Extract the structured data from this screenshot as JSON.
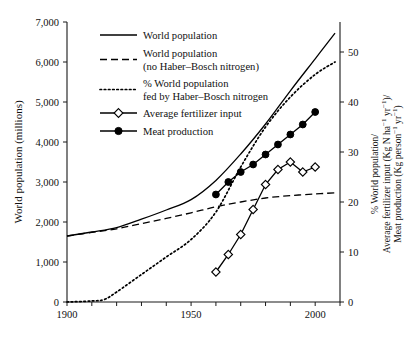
{
  "chart_data": {
    "type": "line",
    "title": "",
    "xlabel": "",
    "ylabel": "World population (millions)",
    "y2label_lines": [
      "% World population/",
      "Average fertilizer input (Kg N ha−1 yr−1)/",
      "Meat production (Kg person−1 yr−1)"
    ],
    "xlim": [
      1900,
      2010
    ],
    "ylim": [
      0,
      7000
    ],
    "y2lim": [
      0,
      56
    ],
    "grid": false,
    "legend_position": "top-left-inside",
    "xticks": [
      1900,
      1910,
      1920,
      1930,
      1940,
      1950,
      1960,
      1970,
      1980,
      1990,
      2000,
      2010
    ],
    "xtick_labels": [
      "1900",
      "",
      "",
      "",
      "",
      "1950",
      "",
      "",
      "",
      "",
      "2000",
      ""
    ],
    "yticks": [
      0,
      1000,
      2000,
      3000,
      4000,
      5000,
      6000,
      7000
    ],
    "ytick_labels": [
      "0",
      "1,000",
      "2,000",
      "3,000",
      "4,000",
      "5,000",
      "6,000",
      "7,000"
    ],
    "y2ticks": [
      0,
      10,
      20,
      30,
      40,
      50
    ],
    "y2tick_labels": [
      "0",
      "10",
      "20",
      "30",
      "40",
      "50"
    ],
    "series": [
      {
        "name": "World population",
        "axis": "left",
        "style": "solid",
        "marker": "none",
        "color": "#000000",
        "x": [
          1900,
          1910,
          1920,
          1930,
          1940,
          1950,
          1960,
          1970,
          1980,
          1990,
          2000,
          2008
        ],
        "values": [
          1650,
          1750,
          1860,
          2070,
          2300,
          2560,
          3040,
          3700,
          4450,
          5280,
          6080,
          6720
        ]
      },
      {
        "name": "World population (no Haber–Bosch nitrogen)",
        "axis": "left",
        "style": "dashed",
        "marker": "none",
        "color": "#000000",
        "x": [
          1900,
          1910,
          1920,
          1930,
          1940,
          1950,
          1960,
          1970,
          1980,
          1990,
          2000,
          2008
        ],
        "values": [
          1650,
          1740,
          1830,
          1960,
          2090,
          2230,
          2380,
          2500,
          2600,
          2660,
          2700,
          2730
        ]
      },
      {
        "name": "% World population fed by Haber–Bosch nitrogen",
        "axis": "right",
        "style": "dotted",
        "marker": "none",
        "color": "#000000",
        "x": [
          1900,
          1910,
          1915,
          1920,
          1930,
          1940,
          1950,
          1960,
          1970,
          1980,
          1990,
          2000,
          2008
        ],
        "values": [
          0,
          0.2,
          0.5,
          2.0,
          5.5,
          9.0,
          12.5,
          18.0,
          27.0,
          35.0,
          41.0,
          45.5,
          48.0
        ]
      },
      {
        "name": "Average fertilizer input",
        "axis": "right",
        "style": "solid",
        "marker": "open-diamond",
        "color": "#000000",
        "x": [
          1960,
          1965,
          1970,
          1975,
          1980,
          1985,
          1990,
          1995,
          2000
        ],
        "values": [
          6.0,
          9.5,
          13.5,
          18.5,
          23.5,
          26.5,
          28.0,
          26.0,
          27.0
        ]
      },
      {
        "name": "Meat production",
        "axis": "right",
        "style": "solid",
        "marker": "closed-circle",
        "color": "#000000",
        "x": [
          1960,
          1965,
          1970,
          1975,
          1980,
          1985,
          1990,
          1995,
          2000
        ],
        "values": [
          21.5,
          24.0,
          26.0,
          27.5,
          29.5,
          31.5,
          33.5,
          35.5,
          38.0
        ]
      }
    ]
  },
  "legend": {
    "entries": [
      {
        "label_lines": [
          "World population"
        ],
        "style": "solid",
        "marker": "none"
      },
      {
        "label_lines": [
          "World population",
          "(no Haber–Bosch nitrogen)"
        ],
        "style": "dashed",
        "marker": "none"
      },
      {
        "label_lines": [
          "% World population",
          "fed by Haber–Bosch nitrogen"
        ],
        "style": "dotted",
        "marker": "none"
      },
      {
        "label_lines": [
          "Average fertilizer input"
        ],
        "style": "solid",
        "marker": "open-diamond"
      },
      {
        "label_lines": [
          "Meat production"
        ],
        "style": "solid",
        "marker": "closed-circle"
      }
    ]
  },
  "colors": {
    "ink": "#111111",
    "line": "#000000",
    "background": "#ffffff"
  }
}
